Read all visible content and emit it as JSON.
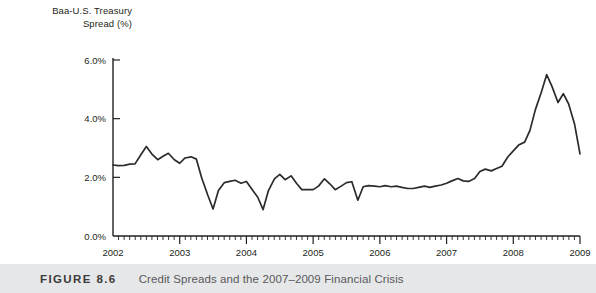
{
  "figure": {
    "number_label": "FIGURE 8.6",
    "caption": "Credit Spreads and the 2007–2009 Financial Crisis"
  },
  "axis_title_line1": "Baa-U.S. Treasury",
  "axis_title_line2": "Spread (%)",
  "colors": {
    "line": "#2b2b2b",
    "axis": "#231f20",
    "caption_band": "#e6e7e8",
    "background": "#ffffff"
  },
  "chart_data": {
    "type": "line",
    "title": "",
    "subtitle": "",
    "xlabel": "",
    "ylabel": "Baa-U.S. Treasury Spread (%)",
    "grid": false,
    "legend": "none",
    "xlim": [
      2002.0,
      2009.0
    ],
    "ylim": [
      0.0,
      6.0
    ],
    "ytick_labels": [
      "0.0%",
      "2.0%",
      "4.0%",
      "6.0%"
    ],
    "ytick_values": [
      0.0,
      2.0,
      4.0,
      6.0
    ],
    "xtick_labels": [
      "2002",
      "2003",
      "2004",
      "2005",
      "2006",
      "2007",
      "2008",
      "2009"
    ],
    "xtick_values": [
      2002,
      2003,
      2004,
      2005,
      2006,
      2007,
      2008,
      2009
    ],
    "x_minor_ticks_per_year": 12,
    "series": [
      {
        "name": "Baa-U.S. Treasury Spread",
        "x": [
          2002.0,
          2002.08,
          2002.17,
          2002.25,
          2002.33,
          2002.42,
          2002.5,
          2002.58,
          2002.67,
          2002.75,
          2002.83,
          2002.92,
          2003.0,
          2003.08,
          2003.17,
          2003.25,
          2003.33,
          2003.42,
          2003.5,
          2003.58,
          2003.67,
          2003.75,
          2003.83,
          2003.92,
          2004.0,
          2004.08,
          2004.17,
          2004.25,
          2004.33,
          2004.42,
          2004.5,
          2004.58,
          2004.67,
          2004.75,
          2004.83,
          2004.92,
          2005.0,
          2005.08,
          2005.17,
          2005.25,
          2005.33,
          2005.42,
          2005.5,
          2005.58,
          2005.67,
          2005.75,
          2005.83,
          2005.92,
          2006.0,
          2006.08,
          2006.17,
          2006.25,
          2006.33,
          2006.42,
          2006.5,
          2006.58,
          2006.67,
          2006.75,
          2006.83,
          2006.92,
          2007.0,
          2007.08,
          2007.17,
          2007.25,
          2007.33,
          2007.42,
          2007.5,
          2007.58,
          2007.67,
          2007.75,
          2007.83,
          2007.92,
          2008.0,
          2008.08,
          2008.17,
          2008.25,
          2008.33,
          2008.42,
          2008.5,
          2008.58,
          2008.67,
          2008.75,
          2008.83,
          2008.92,
          2009.0
        ],
        "values": [
          2.42,
          2.4,
          2.41,
          2.45,
          2.46,
          2.78,
          3.05,
          2.8,
          2.6,
          2.72,
          2.82,
          2.6,
          2.48,
          2.66,
          2.7,
          2.62,
          1.98,
          1.4,
          0.92,
          1.55,
          1.82,
          1.86,
          1.9,
          1.8,
          1.86,
          1.6,
          1.32,
          0.9,
          1.55,
          1.95,
          2.1,
          1.92,
          2.05,
          1.8,
          1.58,
          1.58,
          1.58,
          1.7,
          1.95,
          1.78,
          1.58,
          1.7,
          1.82,
          1.85,
          1.22,
          1.68,
          1.72,
          1.7,
          1.68,
          1.72,
          1.68,
          1.7,
          1.66,
          1.62,
          1.62,
          1.66,
          1.7,
          1.66,
          1.7,
          1.74,
          1.8,
          1.88,
          1.96,
          1.88,
          1.86,
          1.96,
          2.2,
          2.28,
          2.22,
          2.3,
          2.38,
          2.7,
          2.9,
          3.1,
          3.2,
          3.6,
          4.3,
          4.9,
          5.5,
          5.1,
          4.55,
          4.85,
          4.5,
          3.8,
          2.8
        ]
      }
    ],
    "annotations": [
      {
        "text": "Peak spread",
        "x": 2008.5,
        "y": 5.5
      }
    ]
  }
}
